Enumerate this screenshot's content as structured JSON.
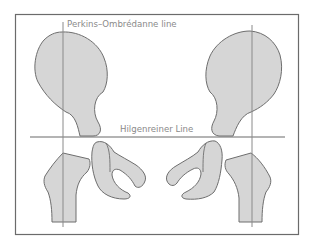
{
  "diagram": {
    "labels": {
      "perkins": "Perkins–Ombrédanne line",
      "hilgenreiner": "Hilgenreiner Line"
    },
    "colors": {
      "bone_fill": "#d6d6d6",
      "bone_stroke": "#6e6e6e",
      "line": "#6b6b6b",
      "frame": "#6b6b6b",
      "label_text": "#8a8a8a"
    },
    "structures": [
      "left-ilium",
      "right-ilium",
      "left-femur",
      "right-femur",
      "left-ischiopubic",
      "right-ischiopubic"
    ]
  }
}
